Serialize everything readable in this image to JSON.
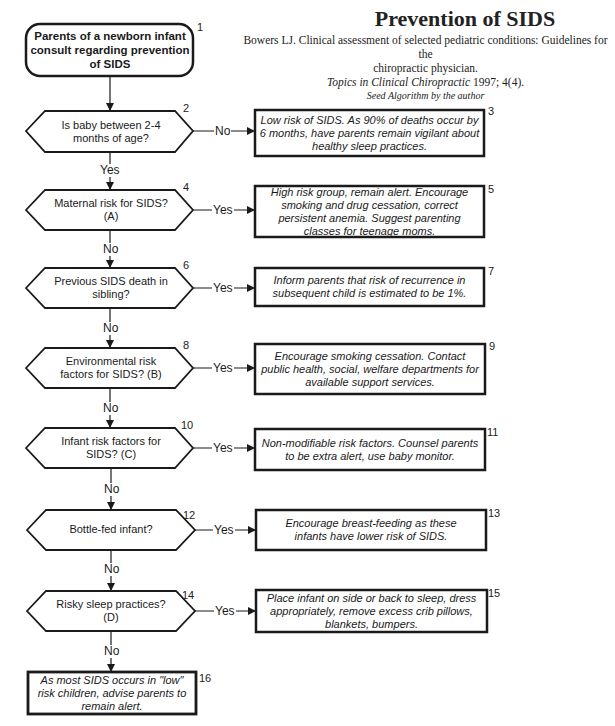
{
  "header": {
    "title": "Prevention of SIDS",
    "citation_line1": "Bowers LJ. Clinical assessment of selected pediatric conditions: Guidelines for the",
    "citation_line2": "chiropractic physician.",
    "journal": "Topics in Clinical Chiropractic",
    "journal_detail": " 1997; 4(4).",
    "seed": "Seed Algorithm by the author"
  },
  "nodes": {
    "n1": {
      "num": "1",
      "text": "Parents of a newborn infant consult regarding prevention of SIDS",
      "type": "start"
    },
    "n2": {
      "num": "2",
      "text": "Is baby between 2-4 months of age?",
      "type": "decision"
    },
    "n3": {
      "num": "3",
      "text": "Low risk of SIDS. As 90% of deaths occur by 6 months, have parents remain  vigilant about healthy sleep practices.",
      "type": "action"
    },
    "n4": {
      "num": "4",
      "text": "Maternal risk for SIDS? (A)",
      "type": "decision"
    },
    "n5": {
      "num": "5",
      "text": "High risk group, remain alert. Encourage smoking and drug cessation, correct persistent anemia. Suggest parenting classes for teenage moms.",
      "type": "action"
    },
    "n6": {
      "num": "6",
      "text": "Previous SIDS death in sibling?",
      "type": "decision"
    },
    "n7": {
      "num": "7",
      "text": "Inform parents that risk of recurrence in subsequent child is estimated to be 1%.",
      "type": "action"
    },
    "n8": {
      "num": "8",
      "text": "Environmental risk factors for SIDS? (B)",
      "type": "decision"
    },
    "n9": {
      "num": "9",
      "text": "Encourage smoking cessation. Contact public health, social, welfare departments for available support services.",
      "type": "action"
    },
    "n10": {
      "num": "10",
      "text": "Infant risk factors for SIDS? (C)",
      "type": "decision"
    },
    "n11": {
      "num": "11",
      "text": "Non-modifiable risk factors. Counsel parents to be extra alert, use baby monitor.",
      "type": "action"
    },
    "n12": {
      "num": "12",
      "text": "Bottle-fed infant?",
      "type": "decision"
    },
    "n13": {
      "num": "13",
      "text": "Encourage breast-feeding as these infants have lower risk of SIDS.",
      "type": "action"
    },
    "n14": {
      "num": "14",
      "text": "Risky sleep practices? (D)",
      "type": "decision"
    },
    "n15": {
      "num": "15",
      "text": "Place infant on side or back to sleep, dress appropriately, remove excess crib pillows, blankets, bumpers.",
      "type": "action"
    },
    "n16": {
      "num": "16",
      "text": "As most SIDS occurs in \"low\" risk children, advise parents to remain alert.",
      "type": "end"
    }
  },
  "edges": {
    "e2_3": "No",
    "e2_4": "Yes",
    "e4_5": "Yes",
    "e4_6": "No",
    "e6_7": "Yes",
    "e6_8": "No",
    "e8_9": "Yes",
    "e8_10": "No",
    "e10_11": "Yes",
    "e10_12": "No",
    "e12_13": "Yes",
    "e12_14": "No",
    "e14_15": "Yes",
    "e14_16": "No"
  },
  "colors": {
    "stroke": "#1a1a1a",
    "background": "#ffffff"
  }
}
